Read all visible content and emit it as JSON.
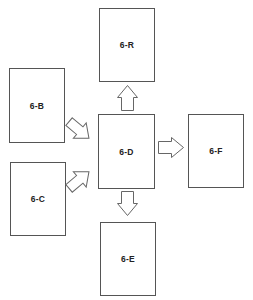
{
  "diagram": {
    "type": "flow",
    "boxes": [
      {
        "id": "6-R",
        "label": "6-R"
      },
      {
        "id": "6-B",
        "label": "6-B"
      },
      {
        "id": "6-C",
        "label": "6-C"
      },
      {
        "id": "6-D",
        "label": "6-D"
      },
      {
        "id": "6-F",
        "label": "6-F"
      },
      {
        "id": "6-E",
        "label": "6-E"
      }
    ],
    "edges": [
      {
        "from": "6-B",
        "to": "6-D",
        "direction": "down-right"
      },
      {
        "from": "6-C",
        "to": "6-D",
        "direction": "up-right"
      },
      {
        "from": "6-D",
        "to": "6-R",
        "direction": "up"
      },
      {
        "from": "6-D",
        "to": "6-F",
        "direction": "right"
      },
      {
        "from": "6-D",
        "to": "6-E",
        "direction": "down"
      }
    ],
    "colors": {
      "box_border": "#555555",
      "arrow_stroke": "#666666",
      "label": "#222222",
      "background": "#ffffff"
    }
  }
}
